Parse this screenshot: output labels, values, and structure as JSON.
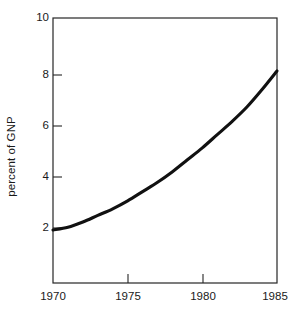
{
  "chart_data": {
    "type": "line",
    "title": "",
    "subtitle": "",
    "xlabel": "",
    "ylabel": "percent of GNP",
    "xlim": [
      1970,
      1985
    ],
    "ylim": [
      0,
      10
    ],
    "grid": false,
    "legend": "none",
    "x_ticks": [
      1970,
      1975,
      1980,
      1985
    ],
    "x_tick_labels": [
      "1970",
      "1975",
      "1980",
      "1985"
    ],
    "y_ticks": [
      2,
      4,
      6,
      8,
      10
    ],
    "y_tick_labels": [
      "2",
      "4",
      "6",
      "8",
      "10"
    ],
    "y_axis_visible_start": 2,
    "series": [
      {
        "name": "percent of GNP",
        "color": "#111111",
        "x": [
          1970,
          1971,
          1972,
          1973,
          1974,
          1975,
          1976,
          1977,
          1978,
          1979,
          1980,
          1981,
          1982,
          1983,
          1984,
          1985
        ],
        "values": [
          2.0,
          2.1,
          2.3,
          2.55,
          2.8,
          3.1,
          3.45,
          3.8,
          4.2,
          4.65,
          5.1,
          5.6,
          6.1,
          6.65,
          7.3,
          8.0
        ]
      }
    ],
    "annotations": []
  },
  "axes": {
    "y_title": "percent of GNP",
    "y_tick_labels": [
      "10",
      "8",
      "6",
      "4",
      "2"
    ],
    "x_tick_labels": [
      "1970",
      "1975",
      "1980",
      "1985"
    ]
  },
  "colors": {
    "curve": "#111111",
    "frame": "#262626",
    "background": "#ffffff",
    "text": "#1a1a1a"
  }
}
